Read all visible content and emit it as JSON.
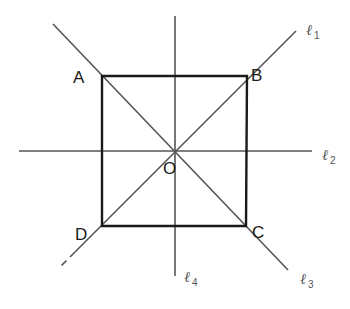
{
  "diagram": {
    "title": "",
    "colors": {
      "square": "#1a1a1a",
      "lines": "#555555",
      "labels": "#1a1a1a",
      "line_labels": "#555555",
      "background": "#ffffff"
    },
    "square": {
      "vertices": [
        {
          "name": "A",
          "x": 102,
          "y": 76
        },
        {
          "name": "B",
          "x": 247,
          "y": 76
        },
        {
          "name": "C",
          "x": 246,
          "y": 226
        },
        {
          "name": "D",
          "x": 102,
          "y": 226
        }
      ]
    },
    "center": {
      "name": "O",
      "x": 175,
      "y": 151
    },
    "points": {
      "A": {
        "label": "A",
        "x": 73,
        "y": 83
      },
      "B": {
        "label": "B",
        "x": 251,
        "y": 81
      },
      "C": {
        "label": "C",
        "x": 252,
        "y": 238
      },
      "D": {
        "label": "D",
        "x": 75,
        "y": 240
      },
      "O": {
        "label": "O",
        "x": 163,
        "y": 174
      }
    },
    "lines": [
      {
        "id": "l1",
        "label": "ℓ",
        "subscript": "1",
        "label_x": 306,
        "label_y": 35,
        "from": [
          296,
          31
        ],
        "to": [
          75,
          252
        ],
        "dashed_tail": {
          "from": [
            75,
            252
          ],
          "to": [
            59,
            268
          ]
        }
      },
      {
        "id": "l2",
        "label": "ℓ",
        "subscript": "2",
        "label_x": 322,
        "label_y": 160,
        "from": [
          19,
          151
        ],
        "to": [
          312,
          151
        ]
      },
      {
        "id": "l3",
        "label": "ℓ",
        "subscript": "3",
        "label_x": 300,
        "label_y": 284,
        "from": [
          53,
          24
        ],
        "to": [
          288,
          270
        ]
      },
      {
        "id": "l4",
        "label": "ℓ",
        "subscript": "4",
        "label_x": 184,
        "label_y": 282,
        "from": [
          175,
          16
        ],
        "to": [
          175,
          276
        ]
      }
    ]
  }
}
